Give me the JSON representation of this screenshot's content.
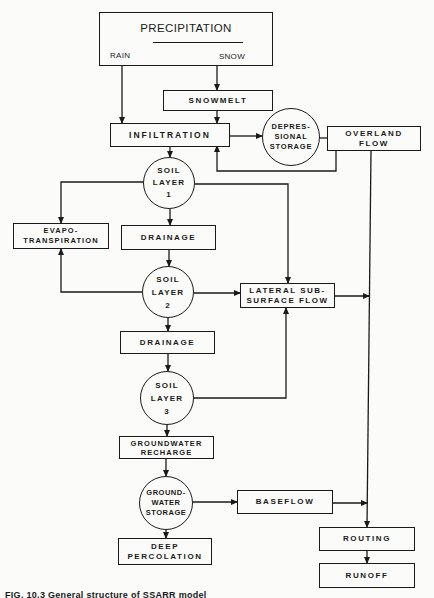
{
  "diagram": {
    "type": "flowchart",
    "nodes": {
      "precipitation": {
        "title": "PRECIPITATION",
        "rain": "RAIN",
        "snow": "SNOW"
      },
      "snowmelt": {
        "label": "SNOWMELT"
      },
      "infiltration": {
        "label": "INFILTRATION"
      },
      "depressional_storage": {
        "label": "DEPRES-\nSIONAL\nSTORAGE"
      },
      "overland_flow": {
        "label": "OVERLAND\nFLOW"
      },
      "soil_layer_1": {
        "label": "SOIL\nLAYER\n1"
      },
      "evapotranspiration": {
        "label": "EVAPO-\nTRANSPIRATION"
      },
      "drainage_1": {
        "label": "DRAINAGE"
      },
      "soil_layer_2": {
        "label": "SOIL\nLAYER\n2"
      },
      "lateral_subsurface_flow": {
        "label": "LATERAL SUB-\nSURFACE FLOW"
      },
      "drainage_2": {
        "label": "DRAINAGE"
      },
      "soil_layer_3": {
        "label": "SOIL\nLAYER\n3"
      },
      "groundwater_recharge": {
        "label": "GROUNDWATER\nRECHARGE"
      },
      "groundwater_storage": {
        "label": "GROUND-\nWATER\nSTORAGE"
      },
      "baseflow": {
        "label": "BASEFLOW"
      },
      "deep_percolation": {
        "label": "DEEP\nPERCOLATION"
      },
      "routing": {
        "label": "ROUTING"
      },
      "runoff": {
        "label": "RUNOFF"
      }
    },
    "edges": [
      [
        "precipitation.rain",
        "infiltration"
      ],
      [
        "precipitation.snow",
        "snowmelt"
      ],
      [
        "snowmelt",
        "infiltration"
      ],
      [
        "infiltration",
        "depressional_storage"
      ],
      [
        "depressional_storage",
        "overland_flow"
      ],
      [
        "overland_flow",
        "infiltration"
      ],
      [
        "infiltration",
        "soil_layer_1"
      ],
      [
        "soil_layer_1",
        "evapotranspiration"
      ],
      [
        "soil_layer_1",
        "drainage_1"
      ],
      [
        "soil_layer_1",
        "lateral_subsurface_flow"
      ],
      [
        "drainage_1",
        "soil_layer_2"
      ],
      [
        "soil_layer_2",
        "evapotranspiration"
      ],
      [
        "soil_layer_2",
        "lateral_subsurface_flow"
      ],
      [
        "soil_layer_2",
        "drainage_2"
      ],
      [
        "drainage_2",
        "soil_layer_3"
      ],
      [
        "soil_layer_3",
        "lateral_subsurface_flow"
      ],
      [
        "soil_layer_3",
        "groundwater_recharge"
      ],
      [
        "groundwater_recharge",
        "groundwater_storage"
      ],
      [
        "groundwater_storage",
        "baseflow"
      ],
      [
        "groundwater_storage",
        "deep_percolation"
      ],
      [
        "overland_flow",
        "routing"
      ],
      [
        "lateral_subsurface_flow",
        "routing"
      ],
      [
        "baseflow",
        "routing"
      ],
      [
        "routing",
        "runoff"
      ]
    ],
    "caption": "FIG. 10.3 General structure of SSARR model"
  },
  "colors": {
    "ink": "#1a1a1a",
    "paper": "#fbfbf9"
  }
}
